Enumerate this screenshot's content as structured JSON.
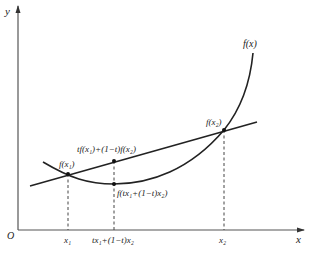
{
  "figure": {
    "axes": {
      "y_label": "y",
      "x_label": "x",
      "origin_label": "O"
    },
    "curve_label": "f(x)",
    "points": {
      "p1_label": "f(x₁)",
      "p2_label": "f(x₂)",
      "chord_mid_label": "tf(x₁)+(1−t)f(x₂)",
      "curve_mid_label": "f(tx₁+(1−t)x₂)"
    },
    "ticks": {
      "x1": "x₁",
      "xmid": "tx₁+(1−t)x₂",
      "x2": "x₂"
    },
    "colors": {
      "line": "#222222",
      "axis": "#555555",
      "background": "#ffffff"
    }
  }
}
